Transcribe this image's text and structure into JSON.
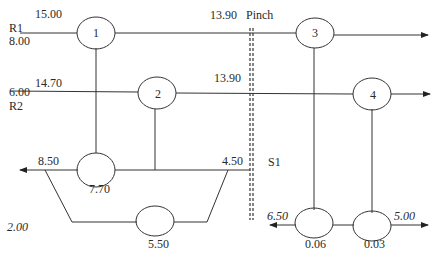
{
  "diagram": {
    "type": "heat-exchanger-network",
    "pinch_label": "Pinch",
    "streams": [
      {
        "name": "R1",
        "supply_temp": "15.00",
        "target_temp": "8.00",
        "pinch_temp": "13.90"
      },
      {
        "name": "R2",
        "supply_temp": "14.70",
        "target_temp": "6.00",
        "pinch_temp": "13.90"
      },
      {
        "name": "S1",
        "left_temp": "8.50",
        "right_temp": "4.50",
        "cooler_temp": "7.70",
        "bypass_temp": "5.50",
        "bypass_value": "2.00"
      }
    ],
    "nodes": [
      {
        "id": "1",
        "label": "1"
      },
      {
        "id": "2",
        "label": "2"
      },
      {
        "id": "3",
        "label": "3"
      },
      {
        "id": "4",
        "label": "4"
      }
    ],
    "bottom_right": {
      "left_value": "6.50",
      "right_value": "5.00",
      "node_a_value": "0.06",
      "node_b_value": "0.03"
    },
    "colors": {
      "line": "#333333",
      "text": "#2a2a2a",
      "background": "#ffffff"
    }
  }
}
